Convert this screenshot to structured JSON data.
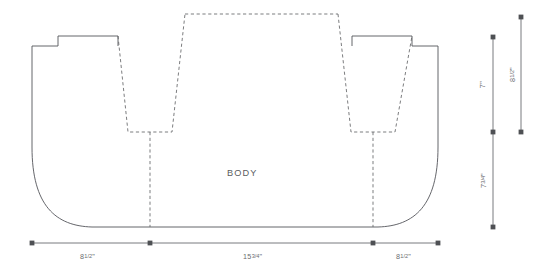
{
  "figure": {
    "title": "BODY",
    "body_label": "BODY",
    "line_color": "#53555a",
    "dimension_color": "#6a6c6f",
    "background": "#ffffff"
  },
  "dimensions": {
    "horizontal": [
      {
        "name": "left-section",
        "label": "8",
        "fraction": "1/2",
        "unit": "\"",
        "full": "8 1/2\""
      },
      {
        "name": "center-section",
        "label": "15",
        "fraction": "3/4",
        "unit": "\"",
        "full": "15 3/4\""
      },
      {
        "name": "right-section",
        "label": "8",
        "fraction": "1/2",
        "unit": "\"",
        "full": "8 1/2\""
      }
    ],
    "vertical": [
      {
        "name": "upper-inner-height",
        "label": "7",
        "fraction": "",
        "unit": "\"",
        "full": "7\""
      },
      {
        "name": "lower-body-height",
        "label": "7",
        "fraction": "3/4",
        "unit": "\"",
        "full": "7 3/4\""
      },
      {
        "name": "overall-outer-height",
        "label": "8",
        "fraction": "1/2",
        "unit": "\"",
        "full": "8 1/2\""
      }
    ]
  },
  "legend": {
    "solid_line": "cut line",
    "dashed_line": "fold / seam line"
  }
}
